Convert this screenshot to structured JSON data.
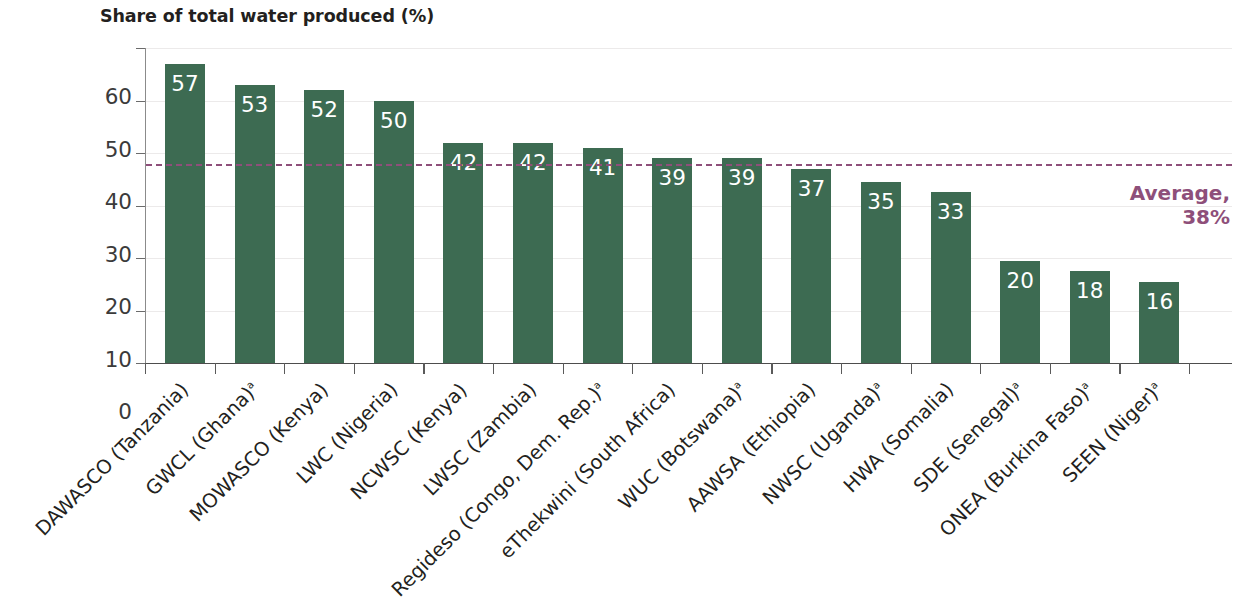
{
  "chart_data": {
    "type": "bar",
    "title": "Share of total water produced (%)",
    "xlabel": "",
    "ylabel": "",
    "ylim": [
      0,
      60
    ],
    "yticks": [
      0,
      10,
      20,
      30,
      40,
      50,
      60
    ],
    "grid": true,
    "legend": null,
    "categories": [
      "DAWASCO (Tanzania)",
      "GWCL (Ghana)",
      "MOWASCO (Kenya)",
      "LWC (Nigeria)",
      "NCWSC (Kenya)",
      "LWSC (Zambia)",
      "Regideso (Congo, Dem. Rep.)",
      "eThekwini (South Africa)",
      "WUC (Botswana)",
      "AAWSA (Ethiopia)",
      "NWSC (Uganda)",
      "HWA (Somalia)",
      "SDE (Senegal)",
      "ONEA (Burkina Faso)",
      "SEEN (Niger)"
    ],
    "category_footnotes": [
      "",
      "a",
      "",
      "",
      "",
      "",
      "a",
      "",
      "a",
      "",
      "a",
      "",
      "a",
      "a",
      "a"
    ],
    "values": [
      57,
      53,
      52,
      50,
      42,
      42,
      41,
      39,
      39,
      37,
      35,
      33,
      20,
      18,
      16
    ],
    "bar_heights_exact": [
      57,
      53,
      52,
      50,
      42,
      42,
      41,
      39,
      39,
      37,
      34.5,
      32.5,
      19.5,
      17.5,
      15.5
    ],
    "data_labels": [
      "57",
      "53",
      "52",
      "50",
      "42",
      "42",
      "41",
      "39",
      "39",
      "37",
      "35",
      "33",
      "20",
      "18",
      "16"
    ],
    "annotations": [
      {
        "name": "average-reference-line",
        "value": 38,
        "label_line1": "Average,",
        "label_line2": "38%",
        "style": "dashed",
        "color": "#8e4f7a"
      }
    ],
    "colors": {
      "bar": "#3d6b52",
      "average": "#8e4f7a",
      "data_label": "#ffffff",
      "axis": "#4d4d4d",
      "grid": "#eceaea",
      "text": "#231f20"
    }
  }
}
